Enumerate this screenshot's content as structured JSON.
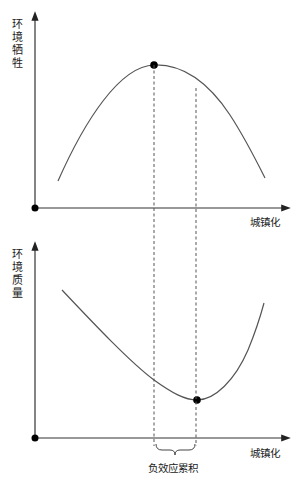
{
  "top_panel": {
    "y_label": "环境牺牲",
    "x_label": "城镇化",
    "curve": "inverted-U",
    "marker": "peak"
  },
  "bottom_panel": {
    "y_label": "环境质量",
    "x_label": "城镇化",
    "curve": "U",
    "marker": "minimum"
  },
  "annotation": {
    "brace_label": "负效应累积"
  },
  "colors": {
    "line": "#555555",
    "axis": "#333333",
    "dot": "#000000"
  }
}
